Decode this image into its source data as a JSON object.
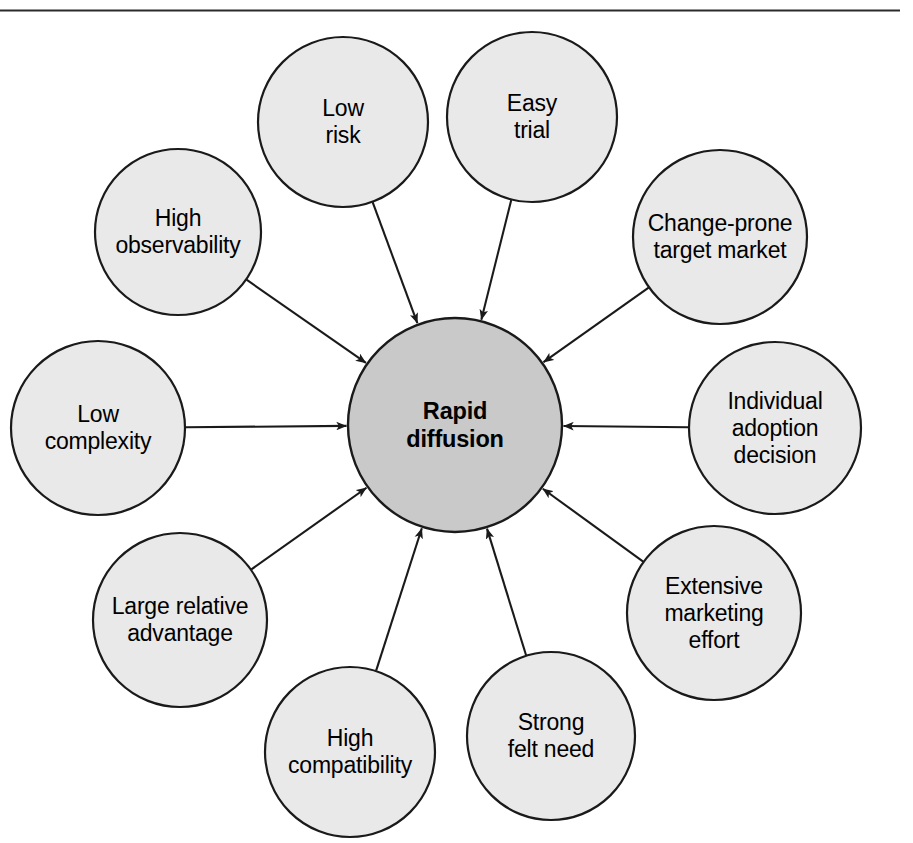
{
  "diagram": {
    "title": "Rapid diffusion",
    "type": "radial-hub-and-spoke",
    "top_rule": {
      "present": true
    },
    "center": {
      "id": "rapid-diffusion",
      "label": "Rapid\ndiffusion",
      "cx": 455,
      "cy": 425,
      "r": 107,
      "fill": "#c9c9c9",
      "stroke": "#1a1a1a",
      "bold": true
    },
    "outer_fill": "#e9e9e9",
    "outer_stroke": "#1a1a1a",
    "arrow_color": "#1a1a1a",
    "nodes": [
      {
        "id": "low-risk",
        "label": "Low\nrisk",
        "cx": 343,
        "cy": 122,
        "r": 85
      },
      {
        "id": "easy-trial",
        "label": "Easy\ntrial",
        "cx": 532,
        "cy": 117,
        "r": 85
      },
      {
        "id": "change-prone-target-market",
        "label": "Change-prone\ntarget market",
        "cx": 720,
        "cy": 237,
        "r": 87
      },
      {
        "id": "individual-adoption-decision",
        "label": "Individual\nadoption\ndecision",
        "cx": 775,
        "cy": 428,
        "r": 86
      },
      {
        "id": "extensive-marketing-effort",
        "label": "Extensive\nmarketing\neffort",
        "cx": 714,
        "cy": 613,
        "r": 87
      },
      {
        "id": "strong-felt-need",
        "label": "Strong\nfelt need",
        "cx": 551,
        "cy": 736,
        "r": 84
      },
      {
        "id": "high-compatibility",
        "label": "High\ncompatibility",
        "cx": 350,
        "cy": 752,
        "r": 85
      },
      {
        "id": "large-relative-advantage",
        "label": "Large relative\nadvantage",
        "cx": 180,
        "cy": 620,
        "r": 87
      },
      {
        "id": "low-complexity",
        "label": "Low\ncomplexity",
        "cx": 98,
        "cy": 428,
        "r": 87
      },
      {
        "id": "high-observability",
        "label": "High\nobservability",
        "cx": 178,
        "cy": 232,
        "r": 83
      }
    ]
  }
}
